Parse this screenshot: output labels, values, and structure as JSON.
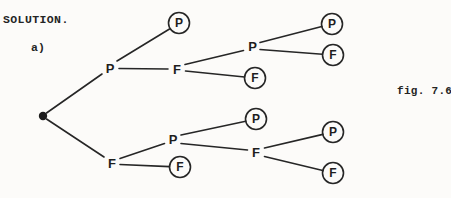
{
  "page": {
    "solution_label": "SOLUTION.",
    "part_label": "a)",
    "figure_caption": "fig. 7.6",
    "background_color": "#fcfbf9",
    "ink_color": "#262626"
  },
  "tree": {
    "type": "probability-tree",
    "root_symbol": "filled-dot",
    "branch_nodes": [
      {
        "id": "upper-level1-P",
        "label": "P"
      },
      {
        "id": "upper-level2-F",
        "label": "F"
      },
      {
        "id": "upper-level3-P",
        "label": "P"
      },
      {
        "id": "lower-level1-F",
        "label": "F"
      },
      {
        "id": "lower-level2-P",
        "label": "P"
      },
      {
        "id": "lower-level3-F",
        "label": "F"
      }
    ],
    "leaf_nodes": [
      {
        "id": "leaf-upper-P1",
        "label": "P",
        "circled": true
      },
      {
        "id": "leaf-upper-P3a",
        "label": "P",
        "circled": true
      },
      {
        "id": "leaf-upper-P3b",
        "label": "F",
        "circled": true
      },
      {
        "id": "leaf-upper-F2",
        "label": "F",
        "circled": true
      },
      {
        "id": "leaf-lower-P2",
        "label": "P",
        "circled": true
      },
      {
        "id": "leaf-lower-F3a",
        "label": "P",
        "circled": true
      },
      {
        "id": "leaf-lower-F3b",
        "label": "F",
        "circled": true
      },
      {
        "id": "leaf-lower-F1",
        "label": "F",
        "circled": true
      }
    ],
    "edges": [
      [
        "root",
        "upper-level1-P"
      ],
      [
        "root",
        "lower-level1-F"
      ],
      [
        "upper-level1-P",
        "leaf-upper-P1"
      ],
      [
        "upper-level1-P",
        "upper-level2-F"
      ],
      [
        "upper-level2-F",
        "upper-level3-P"
      ],
      [
        "upper-level2-F",
        "leaf-upper-F2"
      ],
      [
        "upper-level3-P",
        "leaf-upper-P3a"
      ],
      [
        "upper-level3-P",
        "leaf-upper-P3b"
      ],
      [
        "lower-level1-F",
        "lower-level2-P"
      ],
      [
        "lower-level1-F",
        "leaf-lower-F1"
      ],
      [
        "lower-level2-P",
        "leaf-lower-P2"
      ],
      [
        "lower-level2-P",
        "lower-level3-F"
      ],
      [
        "lower-level3-F",
        "leaf-lower-F3a"
      ],
      [
        "lower-level3-F",
        "leaf-lower-F3b"
      ]
    ]
  }
}
